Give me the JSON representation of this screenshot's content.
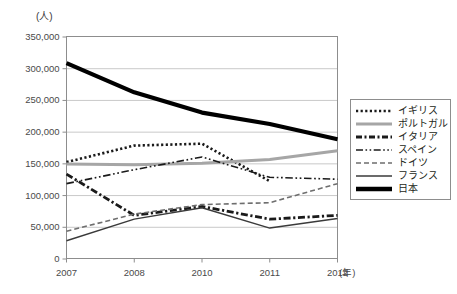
{
  "chart_data": {
    "type": "line",
    "title": "",
    "unit_label": "(人)",
    "xlabel": "(年)",
    "ylabel": "",
    "x": [
      "2007",
      "2008",
      "2010",
      "2011",
      "2012"
    ],
    "categories": [
      "2007",
      "2008",
      "2010",
      "2011",
      "2012"
    ],
    "ylim": [
      0,
      350000
    ],
    "yticks": [
      0,
      50000,
      100000,
      150000,
      200000,
      250000,
      300000,
      350000
    ],
    "ytick_labels": [
      "0",
      "50,000",
      "100,000",
      "150,000",
      "200,000",
      "250,000",
      "300,000",
      "350,000"
    ],
    "grid": true,
    "grid_axis": "y",
    "legend_position": "right",
    "series": [
      {
        "name": "イギリス",
        "style": "dotted",
        "color": "#1a1a1a",
        "width": 2.6,
        "values": [
          152000,
          178000,
          181000,
          122000,
          null
        ]
      },
      {
        "name": "ポルトガル",
        "style": "solid",
        "color": "#a6a6a6",
        "width": 3.0,
        "values": [
          149000,
          148000,
          150000,
          156000,
          170000
        ]
      },
      {
        "name": "イタリア",
        "style": "dash-dot-thick",
        "color": "#1a1a1a",
        "width": 2.8,
        "values": [
          133000,
          68000,
          82000,
          62000,
          68000
        ]
      },
      {
        "name": "スペイン",
        "style": "dash-dot-dot",
        "color": "#1a1a1a",
        "width": 1.6,
        "values": [
          118000,
          140000,
          160000,
          128000,
          125000
        ]
      },
      {
        "name": "ドイツ",
        "style": "dashed",
        "color": "#6e6e6e",
        "width": 1.6,
        "values": [
          43000,
          70000,
          85000,
          88000,
          118000
        ]
      },
      {
        "name": "フランス",
        "style": "solid-thin",
        "color": "#3a3a3a",
        "width": 1.4,
        "values": [
          28000,
          62000,
          80000,
          48000,
          63000
        ]
      },
      {
        "name": "日本",
        "style": "solid-thick",
        "color": "#000000",
        "width": 4.2,
        "values": [
          308000,
          262000,
          230000,
          212000,
          188000
        ]
      }
    ]
  },
  "legend": {
    "items": [
      {
        "label": "イギリス"
      },
      {
        "label": "ポルトガル"
      },
      {
        "label": "イタリア"
      },
      {
        "label": "スペイン"
      },
      {
        "label": "ドイツ"
      },
      {
        "label": "フランス"
      },
      {
        "label": "日本"
      }
    ]
  },
  "axes": {
    "y_unit": "(人)",
    "x_unit": "(年)"
  }
}
